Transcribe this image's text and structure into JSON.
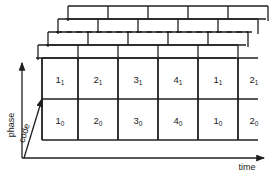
{
  "figure": {
    "title": "",
    "background_color": "#ffffff",
    "line_color": "#1f1f1f",
    "text_color": "#1a1a1a"
  },
  "axes": {
    "vertical": {
      "label": "phase",
      "name": "phase-axis"
    },
    "diagonal": {
      "label": "code",
      "name": "code-axis"
    },
    "horizontal": {
      "label": "time",
      "name": "time-axis"
    }
  },
  "grid": {
    "columns": [
      "1",
      "2",
      "3",
      "4",
      "1",
      "2"
    ],
    "rows": [
      {
        "subscript": "1",
        "cells": [
          {
            "base": "1",
            "sub": "1"
          },
          {
            "base": "2",
            "sub": "1"
          },
          {
            "base": "3",
            "sub": "1"
          },
          {
            "base": "4",
            "sub": "1"
          },
          {
            "base": "1",
            "sub": "1"
          },
          {
            "base": "2",
            "sub": "1"
          }
        ]
      },
      {
        "subscript": "0",
        "cells": [
          {
            "base": "1",
            "sub": "0"
          },
          {
            "base": "2",
            "sub": "0"
          },
          {
            "base": "3",
            "sub": "0"
          },
          {
            "base": "4",
            "sub": "0"
          },
          {
            "base": "1",
            "sub": "0"
          },
          {
            "base": "2",
            "sub": "0"
          }
        ]
      }
    ]
  },
  "stack": {
    "layer_count": 4,
    "dashed_layer_index": 2,
    "description": "receding code layers"
  }
}
